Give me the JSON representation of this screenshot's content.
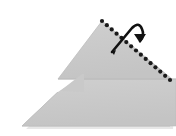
{
  "figure": {
    "type": "origami-instruction",
    "width": 176,
    "height": 136,
    "background_color": "#ffffff"
  },
  "paper": {
    "name": "folded-paper-shape",
    "fill_color": "#c9c9c9",
    "edge_color": "#bdbdbd",
    "shadow_color": "#d9d9d9",
    "outline_points": "102,21 176,78 176,126 170,126 22,126 62,92 82,92 84,76 72,76",
    "upper_flap_points": "102,21 168,79 60,79 102,21",
    "lower_flap_points": "22,126 170,126 176,92 84,92 84,76 72,76"
  },
  "fold_line": {
    "name": "valley-fold-dotted-line",
    "style": "dotted",
    "color": "#1a1a1a",
    "dot_radius": 2.1,
    "start": {
      "x": 102,
      "y": 21
    },
    "end": {
      "x": 170,
      "y": 80
    },
    "dot_count": 15
  },
  "fold_arrow": {
    "name": "fold-direction-arrow",
    "color": "#111111",
    "description": "curved arrow looping up and to the right indicating the flap is folded over the dotted line",
    "tail": {
      "x": 112,
      "y": 52
    },
    "head": {
      "x": 144,
      "y": 38
    },
    "stroke_width": 2.6
  },
  "labels": {
    "step_number": "",
    "caption": ""
  }
}
